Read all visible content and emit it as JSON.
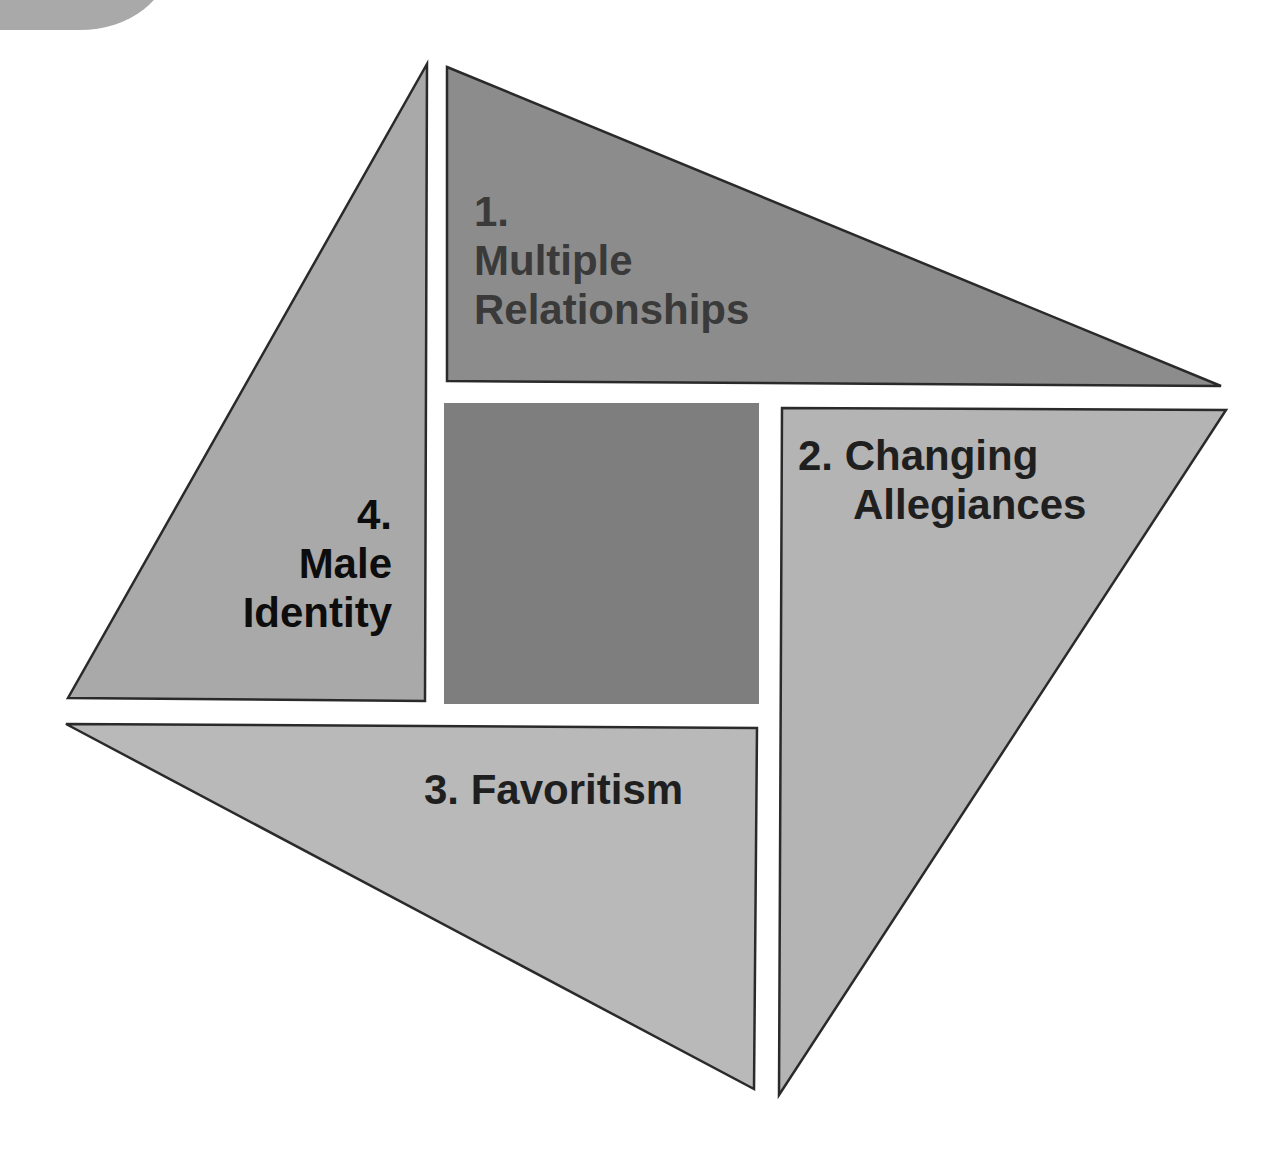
{
  "badge": {
    "label": "Module 6"
  },
  "diagram": {
    "segments": [
      {
        "id": 1,
        "number": "1.",
        "lines": [
          "Multiple",
          "Relationships"
        ],
        "fill": "#8c8c8c",
        "text_color": "#3a3a3a"
      },
      {
        "id": 2,
        "number": "2.",
        "lines": [
          "Changing",
          "Allegiances"
        ],
        "fill": "#b4b4b4",
        "text_color": "#1f1f1f"
      },
      {
        "id": 3,
        "number": "3.",
        "lines": [
          "Favoritism"
        ],
        "fill": "#b9b9b9",
        "text_color": "#1f1f1f"
      },
      {
        "id": 4,
        "number": "4.",
        "lines": [
          "Male",
          "Identity"
        ],
        "fill": "#a9a9a9",
        "text_color": "#0d0d0d"
      }
    ],
    "center_square": {
      "fill": "#7e7e7e"
    },
    "outline_color": "#2a2a2a"
  },
  "text": {
    "seg1_number": "1.",
    "seg1_line1": "Multiple",
    "seg1_line2": "Relationships",
    "seg2_line1": "2. Changing",
    "seg2_line2": "Allegiances",
    "seg3_line1": "3. Favoritism",
    "seg4_number": "4.",
    "seg4_line1": "Male",
    "seg4_line2": "Identity"
  }
}
